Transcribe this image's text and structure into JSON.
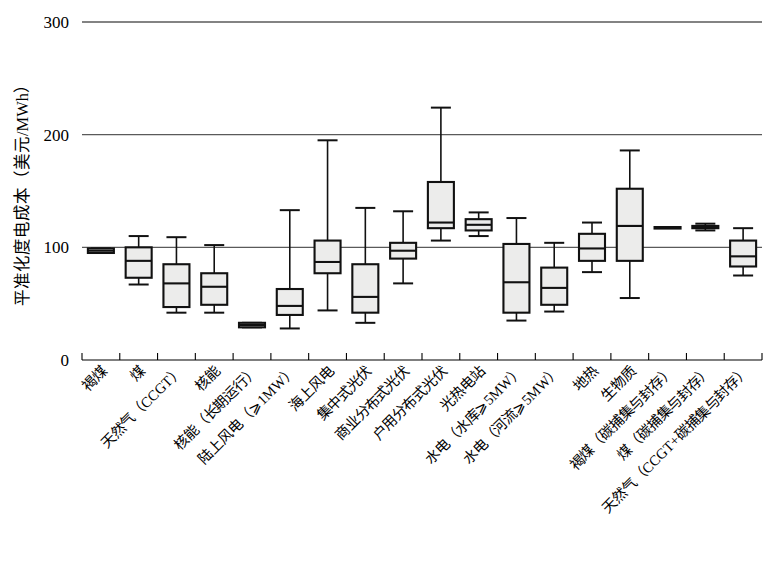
{
  "chart_data": {
    "type": "box",
    "title": "",
    "xlabel": "",
    "ylabel": "平准化度电成本（美元/MWh）",
    "ylim": [
      0,
      300
    ],
    "yticks": [
      0,
      100,
      200,
      300
    ],
    "ytick_labels": [
      "0",
      "100",
      "200",
      "300"
    ],
    "grid": "horizontal-at-100-200-300",
    "legend": "none",
    "units": "USD/MWh",
    "categories": [
      "褐煤",
      "煤",
      "天然气（CCGT）",
      "核能",
      "核能（长期运行）",
      "陆上风电（⩾1MW）",
      "海上风电",
      "集中式光伏",
      "商业分布式光伏",
      "户用分布式光伏",
      "光热电站",
      "水电（水库⩾5MW）",
      "水电（河流⩾5MW）",
      "地热",
      "生物质",
      "褐煤（碳捕集与封存）",
      "煤（碳捕集与封存）",
      "天然气（CCGT+碳捕集与封存）"
    ],
    "boxes": [
      {
        "category": "褐煤",
        "whisker_low": 95,
        "q1": 95,
        "median": 97,
        "q3": 99,
        "whisker_high": 99
      },
      {
        "category": "煤",
        "whisker_low": 67,
        "q1": 73,
        "median": 88,
        "q3": 100,
        "whisker_high": 110
      },
      {
        "category": "天然气（CCGT）",
        "whisker_low": 42,
        "q1": 47,
        "median": 68,
        "q3": 85,
        "whisker_high": 109
      },
      {
        "category": "核能",
        "whisker_low": 42,
        "q1": 49,
        "median": 65,
        "q3": 77,
        "whisker_high": 102
      },
      {
        "category": "核能（长期运行）",
        "whisker_low": 29,
        "q1": 29,
        "median": 31,
        "q3": 33,
        "whisker_high": 33
      },
      {
        "category": "陆上风电（⩾1MW）",
        "whisker_low": 28,
        "q1": 40,
        "median": 48,
        "q3": 63,
        "whisker_high": 133
      },
      {
        "category": "海上风电",
        "whisker_low": 44,
        "q1": 77,
        "median": 87,
        "q3": 106,
        "whisker_high": 195
      },
      {
        "category": "集中式光伏",
        "whisker_low": 33,
        "q1": 42,
        "median": 56,
        "q3": 85,
        "whisker_high": 135
      },
      {
        "category": "商业分布式光伏",
        "whisker_low": 68,
        "q1": 90,
        "median": 97,
        "q3": 104,
        "whisker_high": 132
      },
      {
        "category": "户用分布式光伏",
        "whisker_low": 106,
        "q1": 117,
        "median": 122,
        "q3": 158,
        "whisker_high": 224
      },
      {
        "category": "光热电站",
        "whisker_low": 110,
        "q1": 115,
        "median": 120,
        "q3": 125,
        "whisker_high": 131
      },
      {
        "category": "水电（水库⩾5MW）",
        "whisker_low": 35,
        "q1": 42,
        "median": 69,
        "q3": 103,
        "whisker_high": 126
      },
      {
        "category": "水电（河流⩾5MW）",
        "whisker_low": 43,
        "q1": 49,
        "median": 64,
        "q3": 82,
        "whisker_high": 104
      },
      {
        "category": "地热",
        "whisker_low": 78,
        "q1": 88,
        "median": 99,
        "q3": 112,
        "whisker_high": 122
      },
      {
        "category": "生物质",
        "whisker_low": 55,
        "q1": 88,
        "median": 119,
        "q3": 152,
        "whisker_high": 186
      },
      {
        "category": "褐煤（碳捕集与封存）",
        "whisker_low": 118,
        "q1": 118,
        "median": 118,
        "q3": 118,
        "whisker_high": 118
      },
      {
        "category": "煤（碳捕集与封存）",
        "whisker_low": 115,
        "q1": 117,
        "median": 118,
        "q3": 119,
        "whisker_high": 121
      },
      {
        "category": "天然气（CCGT+碳捕集与封存）",
        "whisker_low": 75,
        "q1": 83,
        "median": 92,
        "q3": 106,
        "whisker_high": 117
      }
    ]
  },
  "colors": {
    "box_fill": "#ececeb",
    "box_stroke": "#111111",
    "gridline": "#5a5a5a",
    "axis": "#000000",
    "background": "#ffffff"
  }
}
